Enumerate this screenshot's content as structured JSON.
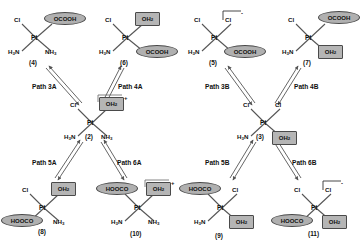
{
  "diagram": {
    "colors": {
      "ligand_ellipse_fill": "#b0b0b0",
      "ligand_square_fill": "#b5b5b5",
      "ligand_stroke": "#4a4a4a",
      "bond_stroke": "#555555",
      "text": "#111111",
      "background": "#ffffff"
    },
    "metal_symbol": "Pt"
  },
  "structures": [
    {
      "id": "s4",
      "number": "(4)",
      "metal": "Pt",
      "ligands": [
        {
          "text": "Cl",
          "shape": "plain",
          "position": "top-left"
        },
        {
          "text": "OCOOH",
          "shape": "ellipse",
          "position": "top-right"
        },
        {
          "text": "H3N",
          "shape": "plain",
          "position": "bottom-left"
        },
        {
          "text": "NH3",
          "shape": "plain",
          "position": "bottom-right"
        }
      ],
      "charge": ""
    },
    {
      "id": "s6",
      "number": "(6)",
      "metal": "Pt",
      "ligands": [
        {
          "text": "Cl",
          "shape": "plain",
          "position": "top-left"
        },
        {
          "text": "OH2",
          "shape": "square",
          "position": "top-right"
        },
        {
          "text": "H3N",
          "shape": "plain",
          "position": "bottom-left"
        },
        {
          "text": "OCOOH",
          "shape": "ellipse",
          "position": "bottom-right"
        }
      ],
      "charge": ""
    },
    {
      "id": "s5",
      "number": "(5)",
      "metal": "Pt",
      "ligands": [
        {
          "text": "Cl",
          "shape": "plain",
          "position": "top-left"
        },
        {
          "text": "Cl",
          "shape": "plain",
          "position": "top-right"
        },
        {
          "text": "H3N",
          "shape": "plain",
          "position": "bottom-left"
        },
        {
          "text": "OCOOH",
          "shape": "ellipse",
          "position": "bottom-right"
        }
      ],
      "charge": "-"
    },
    {
      "id": "s7",
      "number": "(7)",
      "metal": "Pt",
      "ligands": [
        {
          "text": "Cl",
          "shape": "plain",
          "position": "top-left"
        },
        {
          "text": "OCOOH",
          "shape": "ellipse",
          "position": "top-right"
        },
        {
          "text": "H3N",
          "shape": "plain",
          "position": "bottom-left"
        },
        {
          "text": "OH2",
          "shape": "square",
          "position": "bottom-right"
        }
      ],
      "charge": ""
    },
    {
      "id": "s2",
      "number": "(2)",
      "metal": "Pt",
      "ligands": [
        {
          "text": "Cl",
          "shape": "plain",
          "position": "top-left"
        },
        {
          "text": "OH2",
          "shape": "square",
          "position": "top-right"
        },
        {
          "text": "H3N",
          "shape": "plain",
          "position": "bottom-left"
        },
        {
          "text": "NH3",
          "shape": "plain",
          "position": "bottom-right"
        }
      ],
      "charge": "+"
    },
    {
      "id": "s3",
      "number": "(3)",
      "metal": "Pt",
      "ligands": [
        {
          "text": "Cl",
          "shape": "plain",
          "position": "top-left"
        },
        {
          "text": "Cl",
          "shape": "plain",
          "position": "top-right"
        },
        {
          "text": "H3N",
          "shape": "plain",
          "position": "bottom-left"
        },
        {
          "text": "OH2",
          "shape": "square",
          "position": "bottom-right"
        }
      ],
      "charge": ""
    },
    {
      "id": "s8",
      "number": "(8)",
      "metal": "Pt",
      "ligands": [
        {
          "text": "Cl",
          "shape": "plain",
          "position": "top-left"
        },
        {
          "text": "OH2",
          "shape": "square",
          "position": "top-right"
        },
        {
          "text": "HOOCO",
          "shape": "ellipse",
          "position": "bottom-left"
        },
        {
          "text": "NH3",
          "shape": "plain",
          "position": "bottom-right"
        }
      ],
      "charge": ""
    },
    {
      "id": "s10",
      "number": "(10)",
      "metal": "Pt",
      "ligands": [
        {
          "text": "HOOCO",
          "shape": "ellipse",
          "position": "top-left"
        },
        {
          "text": "OH2",
          "shape": "square",
          "position": "top-right"
        },
        {
          "text": "H3N",
          "shape": "plain",
          "position": "bottom-left"
        },
        {
          "text": "NH3",
          "shape": "plain",
          "position": "bottom-right"
        }
      ],
      "charge": "+"
    },
    {
      "id": "s9",
      "number": "(9)",
      "metal": "Pt",
      "ligands": [
        {
          "text": "HOOCO",
          "shape": "ellipse",
          "position": "top-left"
        },
        {
          "text": "Cl",
          "shape": "plain",
          "position": "top-right"
        },
        {
          "text": "H3N",
          "shape": "plain",
          "position": "bottom-left"
        },
        {
          "text": "OH2",
          "shape": "square",
          "position": "bottom-right"
        }
      ],
      "charge": ""
    },
    {
      "id": "s11",
      "number": "(11)",
      "metal": "Pt",
      "ligands": [
        {
          "text": "Cl",
          "shape": "plain",
          "position": "top-left"
        },
        {
          "text": "Cl",
          "shape": "plain",
          "position": "top-right"
        },
        {
          "text": "HOOCO",
          "shape": "ellipse",
          "position": "bottom-left"
        },
        {
          "text": "OH2",
          "shape": "square",
          "position": "bottom-right"
        }
      ],
      "charge": "-"
    }
  ],
  "paths": [
    {
      "id": "p3a",
      "label": "Path 3A",
      "from": "s2",
      "to": "s4",
      "reversible": true
    },
    {
      "id": "p4a",
      "label": "Path 4A",
      "from": "s2",
      "to": "s6",
      "reversible": true
    },
    {
      "id": "p3b",
      "label": "Path 3B",
      "from": "s3",
      "to": "s5",
      "reversible": true
    },
    {
      "id": "p4b",
      "label": "Path 4B",
      "from": "s3",
      "to": "s7",
      "reversible": true
    },
    {
      "id": "p5a",
      "label": "Path 5A",
      "from": "s2",
      "to": "s8",
      "reversible": true
    },
    {
      "id": "p6a",
      "label": "Path 6A",
      "from": "s2",
      "to": "s10",
      "reversible": true
    },
    {
      "id": "p5b",
      "label": "Path 5B",
      "from": "s3",
      "to": "s9",
      "reversible": true
    },
    {
      "id": "p6b",
      "label": "Path 6B",
      "from": "s3",
      "to": "s11",
      "reversible": true
    }
  ]
}
